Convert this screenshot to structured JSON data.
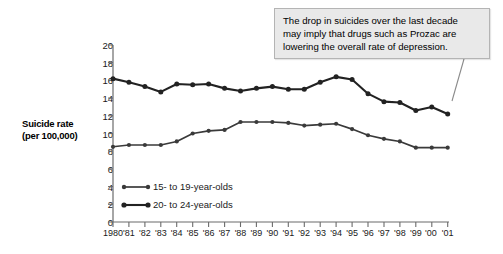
{
  "chart_data": {
    "type": "line",
    "title": "",
    "xlabel": "",
    "ylabel": "Suicide rate (per 100,000)",
    "ylabel_line1": "Suicide rate",
    "ylabel_line2": "(per 100,000)",
    "ylim": [
      0,
      20
    ],
    "ytick_step": 2,
    "yticks": [
      "20",
      "18",
      "16",
      "14",
      "12",
      "10",
      "8",
      "6",
      "4",
      "2",
      "0"
    ],
    "grid": false,
    "legend_position": "inside-lower-left",
    "categories": [
      "1980",
      "'81",
      "'82",
      "'83",
      "'84",
      "'85",
      "'86",
      "'87",
      "'88",
      "'89",
      "'90",
      "'91",
      "'92",
      "'93",
      "'94",
      "'95",
      "'96",
      "'97",
      "'98",
      "'99",
      "'00",
      "'01"
    ],
    "series": [
      {
        "name": "15- to 19-year-olds",
        "color": "#3a3a3a",
        "values": [
          8.5,
          8.7,
          8.7,
          8.7,
          9.1,
          10.0,
          10.3,
          10.4,
          11.3,
          11.3,
          11.3,
          11.2,
          10.9,
          11.0,
          11.1,
          10.5,
          9.8,
          9.4,
          9.1,
          8.4,
          8.4,
          8.4
        ]
      },
      {
        "name": "20- to 24-year-olds",
        "color": "#222222",
        "values": [
          16.2,
          15.8,
          15.3,
          14.7,
          15.6,
          15.5,
          15.6,
          15.1,
          14.8,
          15.1,
          15.3,
          15.0,
          15.0,
          15.8,
          16.4,
          16.1,
          14.5,
          13.6,
          13.5,
          12.6,
          13.0,
          12.2
        ]
      }
    ],
    "annotations": [
      {
        "text": "The drop in suicides over the last decade may imply that drugs such as Prozac are lowering the overall rate of depression.",
        "line1": "The drop in suicides over the last decade",
        "line2": "may imply that drugs such as Prozac are",
        "line3": "lowering the overall rate of depression.",
        "points_to_year": "'01",
        "points_to_value": 14.2
      }
    ]
  },
  "legend": {
    "items": [
      {
        "label": "15- to 19-year-olds"
      },
      {
        "label": "20- to 24-year-olds"
      }
    ]
  }
}
